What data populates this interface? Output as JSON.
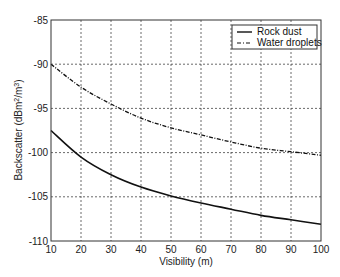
{
  "chart_data": {
    "type": "line",
    "title": "",
    "xlabel": "Visibility (m)",
    "ylabel": "Backscatter (dBm2/m3)",
    "ylabel_parts": {
      "pre": "Backscatter (dBm",
      "sup1": "2",
      "mid": "/m",
      "sup2": "3",
      "post": ")"
    },
    "xlim": [
      10,
      100
    ],
    "ylim": [
      -110,
      -85
    ],
    "xticks": [
      10,
      20,
      30,
      40,
      50,
      60,
      70,
      80,
      90,
      100
    ],
    "yticks": [
      -85,
      -90,
      -95,
      -100,
      -105,
      -110
    ],
    "grid": true,
    "legend_position": "upper right",
    "x": [
      10,
      20,
      30,
      40,
      50,
      60,
      70,
      80,
      90,
      100
    ],
    "series": [
      {
        "name": "Rock dust",
        "style": "solid",
        "values": [
          -97.5,
          -100.5,
          -102.5,
          -103.9,
          -104.9,
          -105.7,
          -106.4,
          -107.1,
          -107.6,
          -108.1
        ]
      },
      {
        "name": "Water droplets",
        "style": "dashdot",
        "values": [
          -90.0,
          -92.6,
          -94.5,
          -96.1,
          -97.2,
          -98.0,
          -98.8,
          -99.5,
          -99.9,
          -100.3
        ]
      }
    ]
  }
}
